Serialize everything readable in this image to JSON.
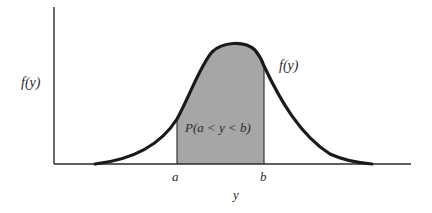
{
  "diagram": {
    "y_axis_label": "f(y)",
    "curve_label": "f(y)",
    "x_axis_label": "y",
    "shaded_region_label": "P(a < y < b)",
    "lower_bound_label": "a",
    "upper_bound_label": "b",
    "colors": {
      "curve": "#1a1a1a",
      "axis": "#2a2a2a",
      "shade": "#a6a6a6",
      "background": "#ffffff"
    }
  }
}
